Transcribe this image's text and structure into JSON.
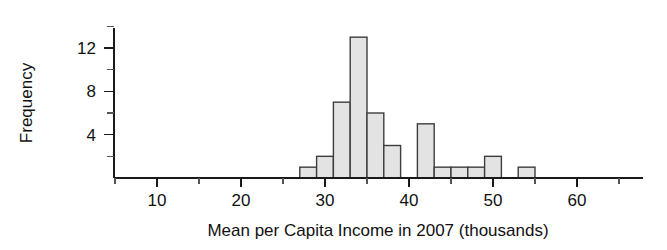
{
  "chart_data": {
    "type": "bar",
    "title": "",
    "subtitle": "",
    "xlabel": "Mean per Capita Income in 2007 (thousands)",
    "ylabel": "Frequency",
    "grid": false,
    "legend": "none",
    "xlim": [
      4,
      66
    ],
    "ylim": [
      0,
      14
    ],
    "bin_width": 2,
    "bin_starts": [
      27,
      29,
      31,
      33,
      35,
      37,
      39,
      41,
      43,
      45,
      47,
      49,
      51,
      53
    ],
    "bin_ends": [
      29,
      31,
      33,
      35,
      37,
      39,
      41,
      43,
      45,
      47,
      49,
      51,
      53,
      55
    ],
    "categories": [
      "27-29",
      "29-31",
      "31-33",
      "33-35",
      "35-37",
      "37-39",
      "39-41",
      "41-43",
      "43-45",
      "45-47",
      "47-49",
      "49-51",
      "51-53",
      "53-55"
    ],
    "values": [
      1,
      2,
      7,
      13,
      6,
      3,
      0,
      5,
      1,
      1,
      1,
      2,
      0,
      1
    ],
    "x_ticks_major": [
      10,
      20,
      30,
      40,
      50,
      60
    ],
    "x_tick_labels": [
      "10",
      "20",
      "30",
      "40",
      "50",
      "60"
    ],
    "x_ticks_minor": [
      5,
      15,
      25,
      35,
      45,
      55,
      65
    ],
    "y_ticks_major": [
      4,
      8,
      12
    ],
    "y_tick_labels": [
      "4",
      "8",
      "12"
    ],
    "y_ticks_minor": [
      2,
      6,
      10,
      14
    ],
    "bar_fill_color": "#e3e3e3",
    "bar_edge_color": "#3d3d3d",
    "axis_color": "#1a1a1a"
  },
  "axes": {
    "x_title": "Mean per Capita Income in 2007 (thousands)",
    "y_title": "Frequency"
  }
}
